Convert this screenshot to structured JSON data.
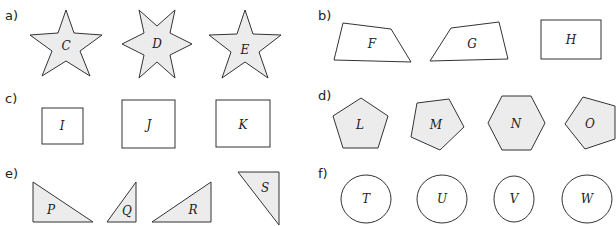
{
  "parts": [
    {
      "label": "a)",
      "kind": "stars",
      "shapes": [
        {
          "name": "C",
          "type": "5-point star"
        },
        {
          "name": "D",
          "type": "6-point star"
        },
        {
          "name": "E",
          "type": "5-point star"
        }
      ]
    },
    {
      "label": "b)",
      "kind": "quadrilaterals",
      "shapes": [
        {
          "name": "F",
          "type": "irregular quadrilateral"
        },
        {
          "name": "G",
          "type": "irregular quadrilateral"
        },
        {
          "name": "H",
          "type": "rectangle"
        }
      ]
    },
    {
      "label": "c)",
      "kind": "rectangles",
      "shapes": [
        {
          "name": "I",
          "type": "rectangle"
        },
        {
          "name": "J",
          "type": "rectangle"
        },
        {
          "name": "K",
          "type": "rectangle"
        }
      ]
    },
    {
      "label": "d)",
      "kind": "polygons",
      "shapes": [
        {
          "name": "L",
          "type": "regular pentagon"
        },
        {
          "name": "M",
          "type": "pentagon (rotated)"
        },
        {
          "name": "N",
          "type": "hexagon"
        },
        {
          "name": "O",
          "type": "pentagon (rotated)"
        }
      ]
    },
    {
      "label": "e)",
      "kind": "right triangles",
      "shapes": [
        {
          "name": "P",
          "type": "right triangle"
        },
        {
          "name": "Q",
          "type": "right triangle"
        },
        {
          "name": "R",
          "type": "right triangle"
        },
        {
          "name": "S",
          "type": "right triangle"
        }
      ]
    },
    {
      "label": "f)",
      "kind": "circles/ellipses",
      "shapes": [
        {
          "name": "T",
          "type": "circle"
        },
        {
          "name": "U",
          "type": "circle"
        },
        {
          "name": "V",
          "type": "ellipse"
        },
        {
          "name": "W",
          "type": "circle"
        }
      ]
    }
  ],
  "colors": {
    "fill_shaded": "#ececec",
    "fill_open": "#ffffff",
    "stroke": "#333333"
  }
}
